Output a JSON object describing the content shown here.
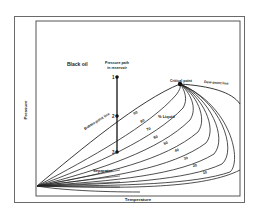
{
  "diagram": {
    "title": "Black oil",
    "x_axis_label": "Temperature",
    "y_axis_label": "Pressure",
    "annotations": {
      "pressure_path": "Pressure path in reservoir",
      "pressure_path_line1": "Pressure path",
      "pressure_path_line2": "in reservoir",
      "critical_point": "Critical point",
      "bubble_point_line": "Bubble-point line",
      "dew_point_line": "Dew-point line",
      "percent_liquid": "% Liquid",
      "separator": "Separator"
    },
    "path_points": [
      "1",
      "2",
      "3"
    ],
    "quality_lines": [
      "90",
      "80",
      "70",
      "60",
      "50",
      "40",
      "30",
      "20",
      "10"
    ],
    "colors": {
      "line": "#222222",
      "frame": "#6a6a6a",
      "background": "#ffffff"
    }
  }
}
